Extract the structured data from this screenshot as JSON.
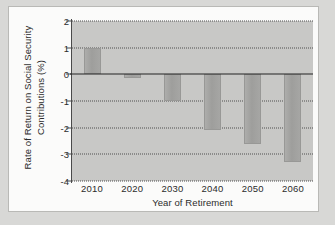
{
  "chart_data": {
    "type": "bar",
    "title": "",
    "xlabel": "Year of Retirement",
    "ylabel": "Rate of Return on Social Security Contributions (%)",
    "ylabel_line1": "Rate of Return on Social Security",
    "ylabel_line2": "Contributions (%)",
    "categories": [
      "2010",
      "2020",
      "2030",
      "2040",
      "2050",
      "2060"
    ],
    "values": [
      1.0,
      -0.15,
      -1.0,
      -2.1,
      -2.6,
      -3.3
    ],
    "ylim": [
      -4,
      2
    ],
    "yticks": [
      "2",
      "1",
      "0",
      "-1",
      "-2",
      "-3",
      "-4"
    ],
    "ytick_values": [
      2,
      1,
      0,
      -1,
      -2,
      -3,
      -4
    ],
    "grid": true,
    "gridlines_at": [
      2,
      1,
      -1,
      -2,
      -3,
      -4
    ],
    "zero_line": 0,
    "legend": "none",
    "series": [
      {
        "name": "Rate of Return on Social Security Contributions (%)",
        "values": [
          1.0,
          -0.15,
          -1.0,
          -2.1,
          -2.6,
          -3.3
        ]
      }
    ],
    "colors": {
      "plot_background": "#c8c8c6",
      "bar_fill": "#a3a3a1",
      "gridline": "#4f4f4f",
      "axis": "#222222",
      "text": "#2b2b2b",
      "card_background": "#fbfbfa",
      "page_background": "#d8d8d6"
    }
  }
}
